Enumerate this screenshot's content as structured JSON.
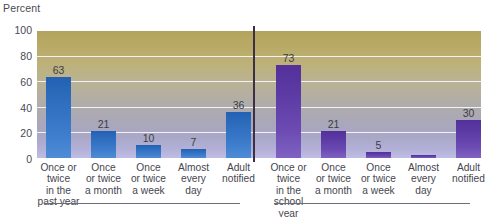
{
  "chart_data": {
    "type": "bar",
    "title": "",
    "ylabel": "Percent",
    "xlabel": "",
    "ylim": [
      0,
      100
    ],
    "yticks": [
      0,
      20,
      40,
      60,
      80,
      100
    ],
    "grid": true,
    "legend": "none",
    "groups": [
      {
        "name": "past year",
        "color": "#2f6dbe",
        "categories": [
          "Once or\ntwice\nin the\npast year",
          "Once\nor twice\na month",
          "Once\nor twice\na week",
          "Almost\nevery\nday",
          "Adult\nnotified"
        ],
        "values": [
          63,
          21,
          10,
          7,
          36
        ],
        "value_labels": [
          "63",
          "21",
          "10",
          "7",
          "36"
        ]
      },
      {
        "name": "school year",
        "color": "#5c3aa4",
        "categories": [
          "Once or\ntwice\nin the\nschool year",
          "Once\nor twice\na month",
          "Once\nor twice\na week",
          "Almost\nevery\nday",
          "Adult\nnotified"
        ],
        "values": [
          73,
          21,
          5,
          2,
          30
        ],
        "value_labels": [
          "73",
          "21",
          "5",
          "",
          "30"
        ]
      }
    ]
  },
  "axis": {
    "percent_label": "Percent",
    "tick_100": "100",
    "tick_80": "80",
    "tick_60": "60",
    "tick_40": "40",
    "tick_20": "20",
    "tick_0": "0"
  },
  "colors": {
    "bar_blue": "#2f6dbe",
    "bar_purple": "#5c3aa4",
    "divider": "#3b3046",
    "gridline": "#f2f2f6",
    "text": "#46464f"
  }
}
